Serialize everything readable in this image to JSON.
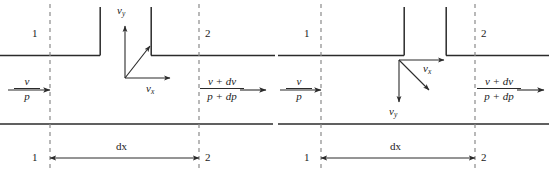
{
  "figure": {
    "type": "technical-diagram",
    "line_color": "#2b2b2b",
    "dashed_color": "#8a8a8a",
    "text_color": "#1b1b1b",
    "background": "#ffffff"
  },
  "panels": [
    {
      "id": "left",
      "station_top_left": "1",
      "station_top_right": "2",
      "station_bottom_left": "1",
      "station_bottom_right": "2",
      "inlet": {
        "velocity": "v",
        "pressure": "p"
      },
      "outlet": {
        "velocity": "v + dv",
        "pressure": "p + dp"
      },
      "length_label": "dx",
      "axes": {
        "vertical_label": "v",
        "vertical_sub": "y",
        "horizontal_label": "v",
        "horizontal_sub": "x",
        "vertical_direction": "up",
        "resultant_direction": "up-right"
      }
    },
    {
      "id": "right",
      "station_top_left": "1",
      "station_top_right": "2",
      "station_bottom_left": "1",
      "station_bottom_right": "2",
      "inlet": {
        "velocity": "v",
        "pressure": "p"
      },
      "outlet": {
        "velocity": "v + dv",
        "pressure": "p + dp"
      },
      "length_label": "dx",
      "axes": {
        "vertical_label": "v",
        "vertical_sub": "y",
        "horizontal_label": "v",
        "horizontal_sub": "x",
        "vertical_direction": "down",
        "resultant_direction": "down-right"
      }
    }
  ]
}
